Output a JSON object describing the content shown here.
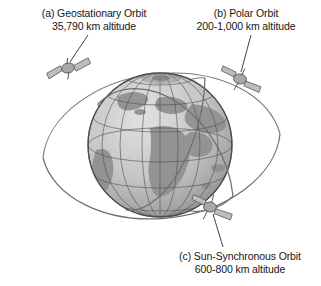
{
  "figure": {
    "background_color": "#ffffff",
    "line_color": "#6e6e6e",
    "text_color": "#161616",
    "globe": {
      "name": "earth-globe",
      "style": "gray wireframe latitude-longitude grid with shaded landmasses",
      "center_x": 160,
      "center_y": 145,
      "radius": 72,
      "fill_color": "#c9c9c9",
      "grid_color": "#4a4a4a",
      "land_color": "#8d8d8d"
    },
    "labels": {
      "a": {
        "key": "(a)",
        "line1": "(a) Geostationary Orbit",
        "line2": "35,790 km altitude",
        "orbit_name": "Geostationary Orbit",
        "altitude": "35,790 km altitude"
      },
      "b": {
        "key": "(b)",
        "line1": "(b) Polar Orbit",
        "line2": "200-1,000 km altitude",
        "orbit_name": "Polar Orbit",
        "altitude": "200-1,000 km altitude"
      },
      "c": {
        "key": "(c)",
        "line1": "(c) Sun-Synchronous Orbit",
        "line2": "600-800 km altitude",
        "orbit_name": "Sun-Synchronous Orbit",
        "altitude": "600-800 km altitude"
      }
    },
    "satellites": [
      {
        "id": "satellite-geostationary",
        "x": 68,
        "y": 68,
        "belongs_to": "(a)"
      },
      {
        "id": "satellite-polar",
        "x": 240,
        "y": 79,
        "belongs_to": "(b)"
      },
      {
        "id": "satellite-sun-synchronous",
        "x": 210,
        "y": 207,
        "belongs_to": "(c)"
      }
    ],
    "orbits": [
      {
        "id": "orbit-geostationary",
        "belongs_to": "(a)",
        "shape": "wide tilted ellipse in equatorial plane"
      },
      {
        "id": "orbit-polar",
        "belongs_to": "(b)",
        "shape": "narrow ellipse through the poles"
      },
      {
        "id": "orbit-sun-synchronous",
        "belongs_to": "(c)",
        "shape": "inclined near-polar ellipse"
      }
    ],
    "leader_lines": [
      {
        "id": "leader-line-a",
        "from_label": "(a)",
        "x1": 88,
        "y1": 35,
        "x2": 70,
        "y2": 63
      },
      {
        "id": "leader-line-b",
        "from_label": "(b)",
        "x1": 250,
        "y1": 35,
        "x2": 240,
        "y2": 72
      },
      {
        "id": "leader-line-c",
        "from_label": "(c)",
        "x1": 222,
        "y1": 247,
        "x2": 213,
        "y2": 213
      }
    ]
  }
}
